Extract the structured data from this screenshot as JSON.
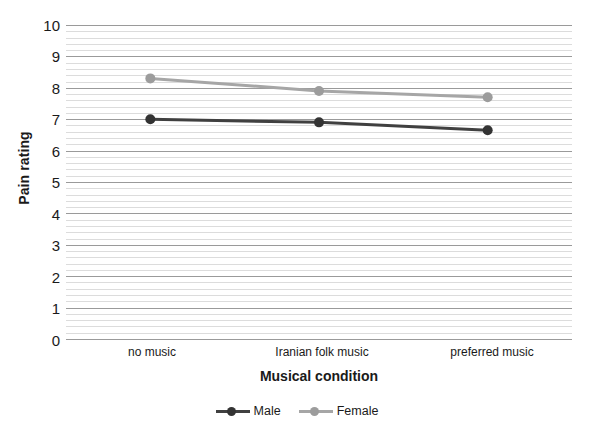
{
  "chart_data": {
    "type": "line",
    "title": "",
    "xlabel": "Musical condition",
    "ylabel": "Pain rating",
    "categories": [
      "no music",
      "Iranian folk music",
      "preferred music"
    ],
    "ylim": [
      0,
      10
    ],
    "y_ticks": [
      0,
      1,
      2,
      3,
      4,
      5,
      6,
      7,
      8,
      9,
      10
    ],
    "y_tick_labels": [
      "0",
      "1",
      "2",
      "3",
      "4",
      "5",
      "6",
      "7",
      "8",
      "9",
      "10"
    ],
    "grid": {
      "major_horizontal": true,
      "minor_horizontal": true,
      "minor_per_major": 5,
      "vertical": false,
      "major_color": "#9a9a9a",
      "minor_color": "#dcdcdc"
    },
    "legend": {
      "position": "bottom-center",
      "entries": [
        "Male",
        "Female"
      ]
    },
    "series": [
      {
        "name": "Male",
        "color": "#404040",
        "marker": "circle",
        "values": [
          7.0,
          6.9,
          6.65
        ]
      },
      {
        "name": "Female",
        "color": "#a6a6a6",
        "marker": "circle",
        "values": [
          8.3,
          7.9,
          7.7
        ]
      }
    ]
  },
  "axis": {
    "y_title": "Pain rating",
    "x_title": "Musical condition"
  },
  "x_labels": {
    "0": "no music",
    "1": "Iranian folk music",
    "2": "preferred music"
  },
  "y_labels": {
    "0": "10",
    "1": "9",
    "2": "8",
    "3": "7",
    "4": "6",
    "5": "5",
    "6": "4",
    "7": "3",
    "8": "2",
    "9": "1",
    "10": "0"
  },
  "legend": {
    "male": "Male",
    "female": "Female"
  }
}
